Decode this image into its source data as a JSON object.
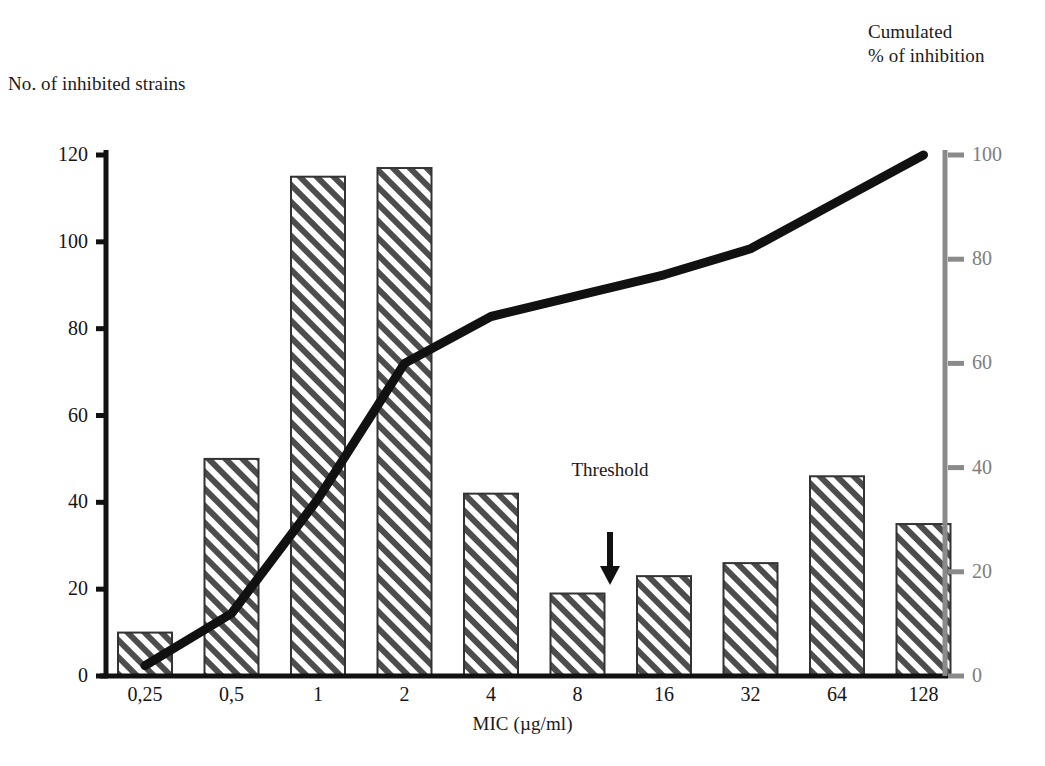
{
  "figure": {
    "left_axis_title": "No. of inhibited strains",
    "right_axis_title_line1": "Cumulated",
    "right_axis_title_line2": "% of inhibition",
    "x_axis_title": "MIC (µg/ml)",
    "threshold_annotation": "Threshold",
    "threshold_arrow_icon": "down-arrow-icon"
  },
  "chart_data": {
    "type": "bar",
    "title": "",
    "subtitle": "",
    "xlabel": "MIC (µg/ml)",
    "ylabel": "No. of inhibited strains",
    "y2label": "Cumulated % of inhibition",
    "categories": [
      "0,25",
      "0,5",
      "1",
      "2",
      "4",
      "8",
      "16",
      "32",
      "64",
      "128"
    ],
    "ylim": [
      0,
      120
    ],
    "yticks": [
      0,
      20,
      40,
      60,
      80,
      100,
      120
    ],
    "ytick_labels": [
      "0",
      "20",
      "40",
      "60",
      "80",
      "100",
      "120"
    ],
    "y2lim": [
      0,
      100
    ],
    "y2ticks": [
      0,
      20,
      40,
      60,
      80,
      100
    ],
    "y2tick_labels": [
      "0",
      "20",
      "40",
      "60",
      "80",
      "100"
    ],
    "grid": false,
    "legend": "none",
    "series": [
      {
        "name": "No. of inhibited strains",
        "type": "bar",
        "axis": "left",
        "fill": "diagonal-hatch",
        "values": [
          10,
          50,
          115,
          117,
          42,
          19,
          23,
          26,
          46,
          35
        ]
      },
      {
        "name": "Cumulated % of inhibition",
        "type": "line",
        "axis": "right",
        "color": "#111111",
        "values": [
          2,
          12,
          34,
          60,
          69,
          73,
          77,
          82,
          91,
          100
        ]
      }
    ],
    "annotations": [
      {
        "text": "Threshold",
        "x_category": "8-16",
        "marker": "down-arrow"
      }
    ]
  },
  "colors": {
    "axis_left": "#111111",
    "axis_right": "#8a8a8a",
    "bar_outline": "#333333",
    "hatch": "#4d4d4d",
    "line": "#111111",
    "text": "#1a1a1a",
    "right_tick_text": "#7d7d7d"
  }
}
